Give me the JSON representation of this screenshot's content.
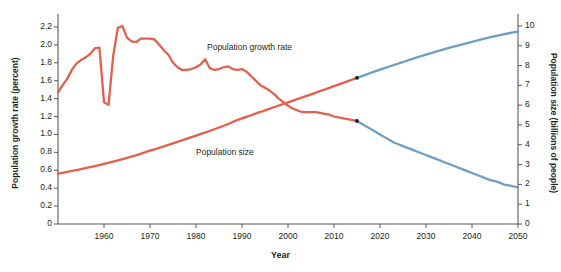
{
  "chart_data": {
    "type": "line",
    "title": "",
    "xlabel": "Year",
    "ylabel": "Population growth rate (percent)",
    "y2label": "Population size (billions of people)",
    "xlim": [
      1950,
      2050
    ],
    "ylim": [
      0,
      2.3
    ],
    "y2lim": [
      0,
      10.4
    ],
    "grid": false,
    "legend_position": "inline-annotations",
    "x_ticks": [
      1960,
      1970,
      1980,
      1990,
      2000,
      2010,
      2020,
      2030,
      2040,
      2050
    ],
    "x_tick_labels": [
      "1960",
      "1970",
      "1980",
      "1990",
      "2000",
      "2010",
      "2020",
      "2030",
      "2040",
      "2050"
    ],
    "y_ticks": [
      0,
      0.2,
      0.4,
      0.6,
      0.8,
      1.0,
      1.2,
      1.4,
      1.6,
      1.8,
      2.0,
      2.2
    ],
    "y_tick_labels": [
      "0",
      "0.2",
      "0.4",
      "0.6",
      "0.8",
      "1.0",
      "1.2",
      "1.4",
      "1.6",
      "1.8",
      "2.0",
      "2.2"
    ],
    "y2_ticks": [
      0,
      1,
      2,
      3,
      4,
      5,
      6,
      7,
      8,
      9,
      10
    ],
    "y2_tick_labels": [
      "0",
      "1",
      "2",
      "3",
      "4",
      "5",
      "6",
      "7",
      "8",
      "9",
      "10"
    ],
    "colors": {
      "historical": "#e2604d",
      "projection": "#6e9ec4",
      "axis": "#58595b",
      "text": "#231f20",
      "marker": "#1a1a1a"
    },
    "annotations": [
      {
        "name": "growth-rate-label",
        "text": "Population growth rate",
        "x": 1982,
        "y": 1.95
      },
      {
        "name": "population-size-label",
        "text": "Population size",
        "x": 1979,
        "y": 0.74
      }
    ],
    "transition_year": 2015,
    "series": [
      {
        "name": "Population growth rate",
        "axis": "left",
        "units": "percent",
        "historical_color": "#e2604d",
        "projection_color": "#6e9ec4",
        "x": [
          1950,
          1951,
          1952,
          1953,
          1954,
          1955,
          1956,
          1957,
          1958,
          1959,
          1960,
          1961,
          1962,
          1963,
          1964,
          1965,
          1966,
          1967,
          1968,
          1969,
          1970,
          1971,
          1972,
          1973,
          1974,
          1975,
          1976,
          1977,
          1978,
          1979,
          1980,
          1981,
          1982,
          1983,
          1984,
          1985,
          1986,
          1987,
          1988,
          1989,
          1990,
          1991,
          1992,
          1993,
          1994,
          1995,
          1996,
          1997,
          1998,
          1999,
          2000,
          2001,
          2002,
          2003,
          2004,
          2005,
          2006,
          2007,
          2008,
          2009,
          2010,
          2011,
          2012,
          2013,
          2014,
          2015,
          2016,
          2017,
          2018,
          2019,
          2020,
          2021,
          2022,
          2023,
          2024,
          2025,
          2026,
          2027,
          2028,
          2029,
          2030,
          2031,
          2032,
          2033,
          2034,
          2035,
          2036,
          2037,
          2038,
          2039,
          2040,
          2041,
          2042,
          2043,
          2044,
          2045,
          2046,
          2047,
          2048,
          2049,
          2050
        ],
        "values": [
          1.47,
          1.55,
          1.62,
          1.72,
          1.79,
          1.83,
          1.86,
          1.9,
          1.96,
          1.97,
          1.36,
          1.33,
          1.88,
          2.19,
          2.21,
          2.08,
          2.04,
          2.03,
          2.07,
          2.07,
          2.07,
          2.06,
          2.0,
          1.94,
          1.89,
          1.8,
          1.75,
          1.72,
          1.72,
          1.73,
          1.75,
          1.78,
          1.84,
          1.74,
          1.72,
          1.73,
          1.75,
          1.76,
          1.73,
          1.72,
          1.73,
          1.7,
          1.65,
          1.6,
          1.55,
          1.52,
          1.49,
          1.45,
          1.4,
          1.36,
          1.32,
          1.29,
          1.27,
          1.25,
          1.25,
          1.25,
          1.25,
          1.24,
          1.23,
          1.22,
          1.2,
          1.19,
          1.18,
          1.17,
          1.16,
          1.15,
          1.12,
          1.09,
          1.06,
          1.03,
          1.0,
          0.97,
          0.94,
          0.91,
          0.89,
          0.87,
          0.85,
          0.83,
          0.81,
          0.79,
          0.77,
          0.75,
          0.73,
          0.71,
          0.69,
          0.67,
          0.65,
          0.63,
          0.61,
          0.59,
          0.57,
          0.55,
          0.53,
          0.51,
          0.49,
          0.48,
          0.46,
          0.44,
          0.43,
          0.42,
          0.41
        ]
      },
      {
        "name": "Population size",
        "axis": "right",
        "units": "billions of people",
        "historical_color": "#e2604d",
        "projection_color": "#6e9ec4",
        "x": [
          1950,
          1955,
          1960,
          1965,
          1970,
          1975,
          1980,
          1985,
          1990,
          1995,
          2000,
          2005,
          2010,
          2015,
          2020,
          2025,
          2030,
          2035,
          2040,
          2045,
          2050
        ],
        "values": [
          2.54,
          2.77,
          3.03,
          3.34,
          3.7,
          4.07,
          4.46,
          4.87,
          5.33,
          5.74,
          6.14,
          6.54,
          6.96,
          7.38,
          7.79,
          8.18,
          8.55,
          8.89,
          9.2,
          9.48,
          9.73
        ]
      }
    ]
  },
  "axis_titles": {
    "left": "Population growth rate (percent)",
    "right": "Population size (billions of people)",
    "bottom": "Year"
  },
  "annotations": {
    "growth_rate": "Population growth rate",
    "population_size": "Population size"
  }
}
